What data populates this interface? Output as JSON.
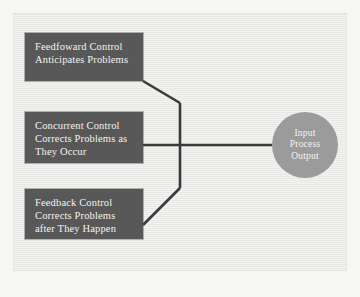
{
  "diagram": {
    "background_color": "#ebebe9",
    "node_fill_color": "#585858",
    "node_text_color": "#f4f2ee",
    "circle_fill_color": "#9b9b9b",
    "circle_text_color": "#f6f4f0",
    "connector_color": "#3a3a3a"
  },
  "nodes": {
    "feedforward": {
      "name": "Feedfoward Control",
      "line1": "Feedfoward Control",
      "line2": "Anticipates Problems"
    },
    "concurrent": {
      "name": "Concurrent Control",
      "line1": "Concurrent Control",
      "line2": "Corrects Problems as",
      "line3": "They Occur"
    },
    "feedback": {
      "name": "Feedback Control",
      "line1": "Feedback Control",
      "line2": "Corrects Problems",
      "line3": "after They Happen"
    },
    "system": {
      "name": "Input Process Output",
      "line1": "Input",
      "line2": "Process",
      "line3": "Output"
    }
  },
  "connectors": [
    {
      "id": "feedforward-to-trunk",
      "from": "feedforward",
      "to": "system",
      "path": "M143,81 L180,103"
    },
    {
      "id": "trunk",
      "from": "junction-top",
      "to": "junction-bottom",
      "path": "M180,103 L180,188"
    },
    {
      "id": "feedback-to-trunk",
      "from": "feedback",
      "to": "system",
      "path": "M143,225 L180,188"
    },
    {
      "id": "concurrent-to-system",
      "from": "concurrent",
      "to": "system",
      "path": "M143,145 L272,145"
    }
  ]
}
